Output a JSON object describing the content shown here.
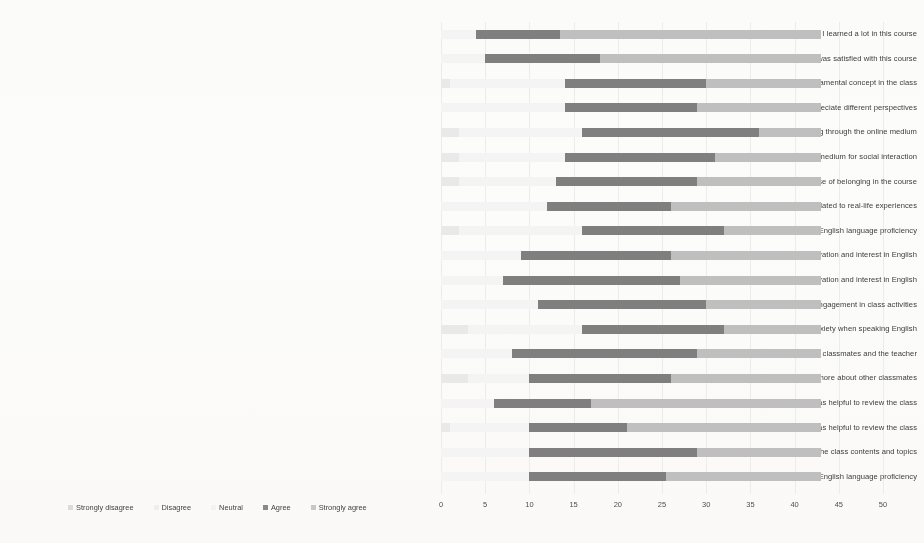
{
  "chart_data": {
    "type": "bar",
    "title": "",
    "subtitle": "",
    "xlabel": "",
    "ylabel": "",
    "orientation": "horizontal",
    "stacked": true,
    "grid": true,
    "legend_position": "bottom-left",
    "xlim": [
      0,
      50
    ],
    "xticks": [
      "0",
      "5",
      "10",
      "15",
      "20",
      "25",
      "30",
      "35",
      "40",
      "45",
      "50"
    ],
    "xtick_values": [
      0,
      5,
      10,
      15,
      20,
      25,
      30,
      35,
      40,
      45,
      50
    ],
    "total_responses": 43,
    "colors": {
      "strongly_disagree": "#e9e9e9",
      "disagree": "#efefef",
      "neutral": "#f4f4f4",
      "agree": "#7f7f7f",
      "strongly_agree": "#bfbfbf"
    },
    "series": [
      {
        "name": "Strongly disagree",
        "values": [
          0,
          0,
          1,
          0,
          2,
          2,
          2,
          0,
          2,
          0,
          0,
          0,
          3,
          0,
          3,
          0,
          1,
          0,
          0
        ]
      },
      {
        "name": "Disagree",
        "values": [
          0,
          0,
          0,
          0,
          0,
          0,
          0,
          0,
          0,
          0,
          0,
          0,
          0,
          0,
          0,
          0,
          0,
          0,
          0
        ]
      },
      {
        "name": "Neutral",
        "values": [
          4,
          5,
          13,
          14,
          14,
          12,
          11,
          12,
          14,
          9,
          7,
          11,
          13,
          8,
          7,
          6,
          9,
          10,
          10
        ]
      },
      {
        "name": "Agree",
        "values": [
          9.5,
          13,
          16,
          15,
          20,
          17,
          16,
          14,
          16,
          17,
          20,
          19,
          16,
          21,
          16,
          11,
          11,
          19,
          15.5
        ]
      },
      {
        "name": "Strongly agree",
        "values": [
          29.5,
          25,
          13,
          14,
          7,
          12,
          14,
          17,
          11,
          17,
          16,
          13,
          11,
          14,
          17,
          26,
          22,
          14,
          17.5
        ]
      }
    ],
    "categories": [
      "19. I learned a lot in this course",
      "18. Overall, I was satisfied with this course",
      "17. Reflection on course content and discussion helped me undrstand fundamental concept in the class",
      "16. Online discussions were valuable in helping me appreciate different perspectives",
      "15. I felt comfortable conversing through the online medium",
      "14. Online communication is an excellent medium for social interaction",
      "13. Getting to know other classmates gave me a sense of belonging in the course",
      "12. Topics were practical and related to real-life experiences",
      "11. Online education has been helpful to improve my English language proficiency",
      "10. Talking with various English speakers has increased my motivation and interest in English",
      "9. Online learning has increased my motivation and interest in English",
      "8. Online learning has increased my confidence and engagement in class activities",
      "7. Online education has reduced my feelings of anxiety when speaking English",
      "6. Thread discussion was helpful to ask questions to, and get feedback from other classmates and the teacher",
      "5. Doing group project helped me get to know more about other classmates",
      "4. Posting PowerPoint slides on Manaba was helpful to review the class",
      "3. Posting the recorded Zoom meeting on Manaba was helpful to review the class",
      "2. Zoom meeting was an effective way of learning about the class contents and topics",
      "1. I believe that this course helped me improve my overall English language proficiency"
    ],
    "rows": [
      {
        "label": "19. I learned a lot in this course",
        "segments": [
          0,
          0,
          4,
          9.5,
          29.5
        ]
      },
      {
        "label": "18. Overall, I was satisfied with this course",
        "segments": [
          0,
          0,
          5,
          13,
          25
        ]
      },
      {
        "label": "17. Reflection on course content and discussion helped me undrstand fundamental concept in the class",
        "segments": [
          1,
          0,
          13,
          16,
          13
        ]
      },
      {
        "label": "16. Online discussions were valuable in helping me appreciate different perspectives",
        "segments": [
          0,
          0,
          14,
          15,
          14
        ]
      },
      {
        "label": "15. I felt comfortable conversing through the online medium",
        "segments": [
          2,
          0,
          14,
          20,
          7
        ]
      },
      {
        "label": "14. Online communication is an excellent medium for social interaction",
        "segments": [
          2,
          0,
          12,
          17,
          12
        ]
      },
      {
        "label": "13. Getting to know other classmates gave me a sense of belonging in the course",
        "segments": [
          2,
          0,
          11,
          16,
          14
        ]
      },
      {
        "label": "12. Topics were practical and related to real-life experiences",
        "segments": [
          0,
          0,
          12,
          14,
          17
        ]
      },
      {
        "label": "11. Online education has been helpful to improve my English language proficiency",
        "segments": [
          2,
          0,
          14,
          16,
          11
        ]
      },
      {
        "label": "10. Talking with various English speakers has increased my motivation and interest in English",
        "segments": [
          0,
          0,
          9,
          17,
          17
        ]
      },
      {
        "label": "9. Online learning has increased my motivation and interest in English",
        "segments": [
          0,
          0,
          7,
          20,
          16
        ]
      },
      {
        "label": "8. Online learning has increased my confidence and engagement in class activities",
        "segments": [
          0,
          0,
          11,
          19,
          13
        ]
      },
      {
        "label": "7. Online education has reduced my feelings of anxiety when speaking English",
        "segments": [
          3,
          0,
          13,
          16,
          11
        ]
      },
      {
        "label": "6. Thread discussion was helpful to ask questions to, and get feedback from other classmates and the teacher",
        "segments": [
          0,
          0,
          8,
          21,
          14
        ]
      },
      {
        "label": "5. Doing group project helped me get to know more about other classmates",
        "segments": [
          3,
          0,
          7,
          16,
          17
        ]
      },
      {
        "label": "4. Posting PowerPoint slides on Manaba was helpful to review the class",
        "segments": [
          0,
          0,
          6,
          11,
          26
        ]
      },
      {
        "label": "3. Posting the recorded Zoom meeting on Manaba was helpful to review the class",
        "segments": [
          1,
          0,
          9,
          11,
          22
        ]
      },
      {
        "label": "2. Zoom meeting was an effective way of learning about the class contents and topics",
        "segments": [
          0,
          0,
          10,
          19,
          14
        ]
      },
      {
        "label": "1. I believe that this course helped me improve my overall English language proficiency",
        "segments": [
          0,
          0,
          10,
          15.5,
          17.5
        ]
      }
    ]
  },
  "legend": {
    "items": [
      {
        "label": "Strongly disagree",
        "swatch": "s0"
      },
      {
        "label": "Disagree",
        "swatch": "s1"
      },
      {
        "label": "Neutral",
        "swatch": "s2"
      },
      {
        "label": "Agree",
        "swatch": "s3"
      },
      {
        "label": "Strongly agree",
        "swatch": "s4"
      }
    ]
  }
}
